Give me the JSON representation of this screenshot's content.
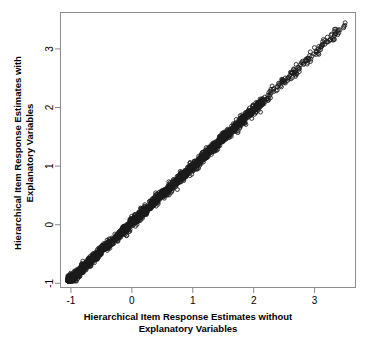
{
  "chart_data": {
    "type": "scatter",
    "title": "",
    "subtitle": "",
    "xlabel": "Hierarchical Item Response Estimates without\nExplanatory Variables",
    "ylabel": "Hierarchical Item Response Estimates with\nExplanatory Variables",
    "xlabel_lines": [
      "Hierarchical Item Response Estimates without",
      "Explanatory Variables"
    ],
    "ylabel_lines": [
      "Hierarchical Item Response Estimates with",
      "Explanatory Variables"
    ],
    "xlim": [
      -1.18,
      3.68
    ],
    "ylim": [
      -1.08,
      3.63
    ],
    "xticks": [
      -1,
      0,
      1,
      2,
      3
    ],
    "ytick_labels": [
      "-1",
      "0",
      "1",
      "2",
      "3"
    ],
    "yticks": [
      -1,
      0,
      1,
      2,
      3
    ],
    "xtick_labels": [
      "-1",
      "0",
      "1",
      "2",
      "3"
    ],
    "grid": false,
    "legend": null,
    "marker": "open-circle",
    "marker_size_px": 4,
    "marker_color": "#1a1a1a",
    "marker_fill": "none",
    "frame": true,
    "frame_color": "#8c8c8c",
    "n_points": 2100,
    "relationship": "near-perfect positive linear, y approximately equals x",
    "series": [
      {
        "name": "Item response estimates",
        "x_range": [
          -1.05,
          3.52
        ],
        "y_range": [
          -0.96,
          3.45
        ],
        "density_note": "Extremely dense overlapping band from (-1,-0.95) to (2.1,2.1); individual circles resolvable above x=2.2 up to x=3.5",
        "slope": 0.965,
        "intercept": 0.03,
        "scatter_sd": 0.045
      }
    ]
  },
  "figure": {
    "width_px": 369,
    "height_px": 346,
    "background": "#ffffff",
    "plot_box": {
      "left": 60,
      "top": 12,
      "right": 356,
      "bottom": 288
    },
    "axis_color": "#8c8c8c",
    "text_color": "#000000"
  }
}
